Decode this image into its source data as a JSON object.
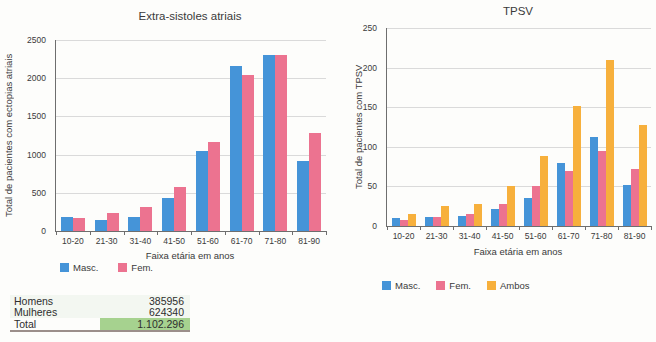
{
  "chart_data": [
    {
      "type": "bar",
      "title": "Extra-sistoles atriais",
      "ylabel": "Total de pacientes com ectopias atriais",
      "xlabel": "Faixa etária em anos",
      "categories": [
        "10-20",
        "21-30",
        "31-40",
        "41-50",
        "51-60",
        "61-70",
        "71-80",
        "81-90"
      ],
      "series": [
        {
          "name": "Masc.",
          "color": "#4594d8",
          "values": [
            180,
            150,
            180,
            430,
            1050,
            2160,
            2310,
            920
          ]
        },
        {
          "name": "Fem.",
          "color": "#ec7390",
          "values": [
            170,
            235,
            310,
            580,
            1160,
            2040,
            2300,
            1280
          ]
        }
      ],
      "ylim": [
        0,
        2500
      ],
      "ytick_step": 500,
      "grid": true,
      "legend_position": "bottom"
    },
    {
      "type": "bar",
      "title": "TPSV",
      "ylabel": "Total de pacientes com TPSV",
      "xlabel": "Faixa etária em anos",
      "categories": [
        "10-20",
        "21-30",
        "31-40",
        "41-50",
        "51-60",
        "61-70",
        "71-80",
        "81-90"
      ],
      "series": [
        {
          "name": "Masc.",
          "color": "#4594d8",
          "values": [
            10,
            12,
            13,
            21,
            35,
            79,
            113,
            52
          ]
        },
        {
          "name": "Fem.",
          "color": "#ec7390",
          "values": [
            7,
            12,
            15,
            28,
            50,
            70,
            95,
            72
          ]
        },
        {
          "name": "Ambos",
          "color": "#f7b03c",
          "values": [
            15,
            25,
            28,
            50,
            88,
            152,
            210,
            128
          ]
        }
      ],
      "ylim": [
        0,
        250
      ],
      "ytick_step": 50,
      "grid": true,
      "legend_position": "bottom"
    }
  ],
  "table": {
    "rows": [
      {
        "label": "Homens",
        "value": "385956"
      },
      {
        "label": "Mulheres",
        "value": "624340"
      },
      {
        "label": "Total",
        "value": "1.102.296"
      }
    ],
    "highlight_color": "#a6d28f"
  },
  "colors": {
    "masc": "#4594d8",
    "fem": "#ec7390",
    "ambos": "#f7b03c",
    "gridline": "#dadada",
    "axis": "#6e6e6e"
  }
}
